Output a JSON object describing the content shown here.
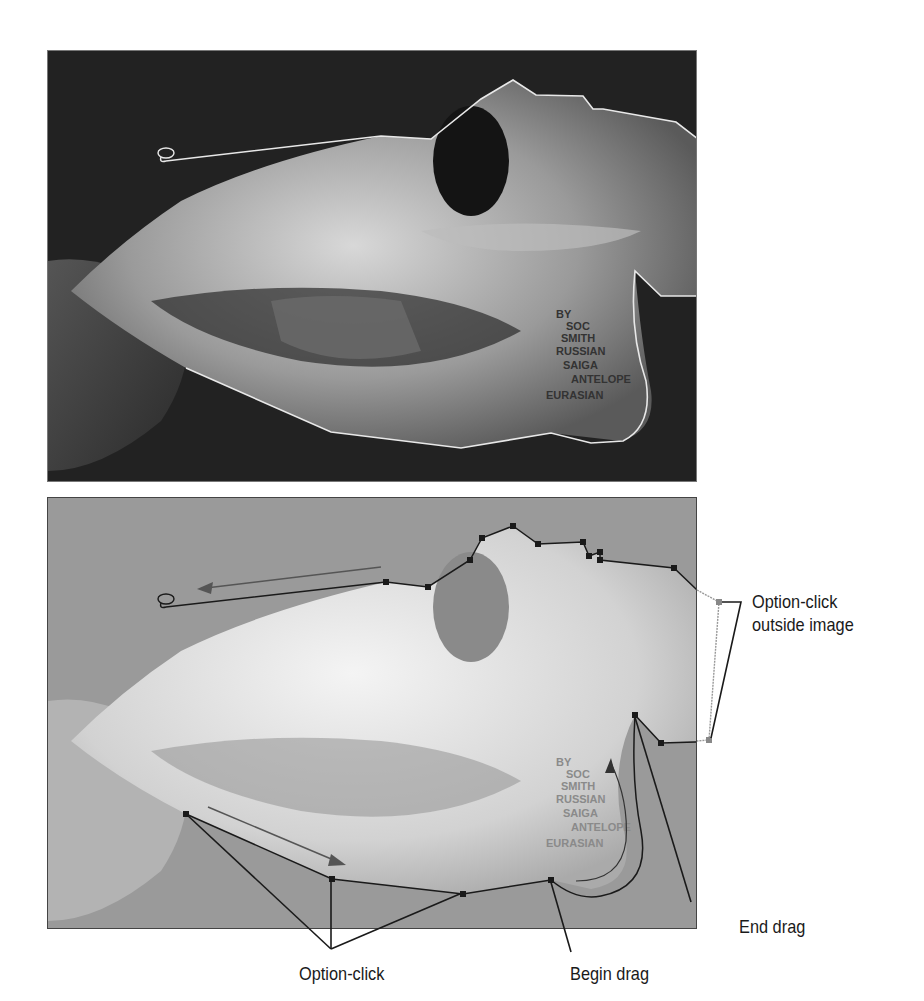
{
  "figure": {
    "panels": [
      {
        "id": "top",
        "description": "Dark photograph of a skull with a completed lasso selection outline (white marching line)",
        "icon": "lasso-icon"
      },
      {
        "id": "bottom",
        "description": "Lightened photograph of the same skull showing a polygonal lasso path with anchor points and callouts",
        "icon": "lasso-icon"
      }
    ],
    "skull_label_text": [
      "BY",
      "SOC",
      "SMITH",
      "RUSSIAN",
      "SAIGA",
      "ANTELOPE",
      "EURASIAN"
    ],
    "callouts": {
      "option_click_outside": [
        "Option-click",
        "outside image"
      ],
      "end_drag": "End drag",
      "option_click": "Option-click",
      "begin_drag": "Begin drag"
    },
    "colors": {
      "top_background": "#1c1c1c",
      "bottom_background": "#8e8e8e",
      "selection_line_top": "#e8e8e8",
      "selection_line_bottom": "#1a1a1a",
      "callout_line": "#1a1a1a"
    }
  }
}
